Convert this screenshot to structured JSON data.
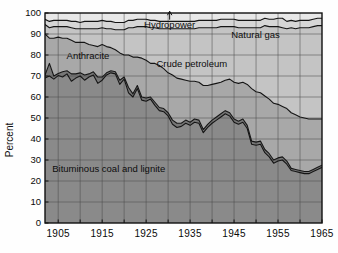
{
  "chart_data": {
    "type": "area",
    "stacked": true,
    "title": "",
    "xlabel": "",
    "ylabel": "Percent",
    "xlim": [
      1902,
      1965
    ],
    "ylim": [
      0,
      100
    ],
    "ytick_labels": [
      "0",
      "10",
      "20",
      "30",
      "40",
      "50",
      "60",
      "70",
      "80",
      "90",
      "100"
    ],
    "yticks": [
      0,
      10,
      20,
      30,
      40,
      50,
      60,
      70,
      80,
      90,
      100
    ],
    "xtick_labels": [
      "1905",
      "1915",
      "1925",
      "1935",
      "1945",
      "1955",
      "1965"
    ],
    "xticks": [
      1905,
      1915,
      1925,
      1935,
      1945,
      1955,
      1965
    ],
    "grid": true,
    "grid_x_step": 5,
    "grid_y_step": 10,
    "legend_position": "inline-annotations",
    "series_order_bottom_to_top": [
      "Bituminous coal and lignite",
      "Anthracite",
      "Crude petroleum",
      "Natural gas",
      "Hydropower"
    ],
    "x": [
      1902,
      1903,
      1904,
      1905,
      1906,
      1907,
      1908,
      1909,
      1910,
      1911,
      1912,
      1913,
      1914,
      1915,
      1916,
      1917,
      1918,
      1919,
      1920,
      1921,
      1922,
      1923,
      1924,
      1925,
      1926,
      1927,
      1928,
      1929,
      1930,
      1931,
      1932,
      1933,
      1934,
      1935,
      1936,
      1937,
      1938,
      1939,
      1940,
      1941,
      1942,
      1943,
      1944,
      1945,
      1946,
      1947,
      1948,
      1949,
      1950,
      1951,
      1952,
      1953,
      1954,
      1955,
      1956,
      1957,
      1958,
      1959,
      1960,
      1961,
      1962,
      1963,
      1964,
      1965
    ],
    "series": [
      {
        "name": "Bituminous coal and lignite",
        "color": "#8a8a8a",
        "label_text": "Bituminous coal and lignite",
        "values": [
          69.0,
          70.0,
          68.5,
          70.2,
          69.5,
          71.0,
          67.5,
          69.0,
          70.0,
          68.0,
          69.5,
          70.5,
          66.5,
          68.0,
          70.5,
          71.5,
          71.0,
          66.0,
          68.5,
          62.0,
          60.0,
          64.0,
          58.5,
          58.0,
          59.0,
          56.0,
          53.5,
          53.0,
          51.0,
          47.0,
          45.5,
          46.0,
          47.5,
          46.5,
          48.0,
          47.5,
          43.0,
          45.5,
          47.5,
          49.0,
          50.5,
          52.0,
          51.0,
          48.0,
          47.0,
          48.0,
          45.0,
          37.5,
          37.0,
          37.5,
          33.5,
          31.5,
          28.5,
          29.5,
          30.0,
          28.0,
          25.0,
          24.5,
          24.0,
          23.5,
          23.5,
          24.5,
          25.5,
          26.5
        ]
      },
      {
        "name": "Anthracite",
        "color": "#777777",
        "label_text": "Anthracite",
        "values": [
          1.5,
          6.0,
          1.5,
          1.0,
          2.5,
          1.5,
          3.5,
          2.0,
          1.5,
          2.5,
          1.5,
          1.5,
          3.0,
          1.5,
          1.0,
          1.0,
          1.0,
          2.0,
          1.0,
          2.5,
          1.5,
          1.5,
          1.5,
          1.5,
          1.0,
          1.5,
          1.5,
          1.5,
          1.5,
          2.0,
          2.0,
          1.5,
          1.5,
          1.5,
          1.5,
          1.5,
          1.5,
          1.5,
          1.5,
          1.5,
          1.5,
          1.5,
          1.5,
          1.5,
          1.5,
          1.5,
          1.5,
          1.5,
          1.5,
          1.5,
          1.5,
          1.5,
          1.5,
          1.5,
          1.5,
          1.5,
          1.0,
          1.0,
          1.0,
          1.0,
          1.0,
          1.0,
          1.0,
          1.0
        ]
      },
      {
        "name": "Crude petroleum",
        "color": "#a8a8a8",
        "label_text": "Crude petroleum",
        "values": [
          19.5,
          12.0,
          18.0,
          17.3,
          16.0,
          15.5,
          16.0,
          15.0,
          14.5,
          15.5,
          14.0,
          12.5,
          14.5,
          15.5,
          12.5,
          11.0,
          10.5,
          13.0,
          10.5,
          15.5,
          17.5,
          13.5,
          18.5,
          18.0,
          16.0,
          18.5,
          20.0,
          19.0,
          19.0,
          21.5,
          21.5,
          21.0,
          19.0,
          19.5,
          18.0,
          18.0,
          21.0,
          18.5,
          17.0,
          16.0,
          15.0,
          14.5,
          16.0,
          17.5,
          18.0,
          17.5,
          19.5,
          25.0,
          24.0,
          23.0,
          25.5,
          26.0,
          27.0,
          25.5,
          24.0,
          25.0,
          26.5,
          26.0,
          25.5,
          25.5,
          25.0,
          24.0,
          23.0,
          22.0
        ]
      },
      {
        "name": "Natural gas",
        "color": "#c4c4c4",
        "label_text": "Natural gas",
        "values": [
          4.5,
          5.0,
          5.5,
          5.0,
          5.5,
          5.5,
          6.0,
          6.5,
          6.5,
          6.5,
          7.5,
          8.0,
          8.5,
          8.0,
          8.5,
          9.0,
          9.5,
          11.0,
          12.0,
          13.0,
          14.0,
          14.5,
          15.0,
          16.0,
          17.0,
          17.0,
          17.5,
          19.0,
          21.0,
          22.0,
          23.5,
          24.0,
          24.5,
          25.0,
          25.0,
          26.0,
          27.5,
          27.5,
          27.0,
          26.5,
          26.5,
          25.5,
          25.0,
          26.5,
          26.5,
          26.0,
          27.0,
          29.0,
          30.5,
          31.0,
          33.5,
          34.5,
          36.5,
          37.0,
          37.5,
          38.0,
          40.5,
          41.0,
          42.5,
          43.0,
          43.5,
          44.0,
          44.5,
          44.5
        ]
      },
      {
        "name": "Hydropower",
        "color": "#d6d6d6",
        "label_text": "Hydropower",
        "values": [
          2.5,
          3.0,
          3.0,
          3.0,
          3.0,
          3.0,
          3.0,
          3.5,
          3.0,
          3.5,
          3.5,
          3.5,
          3.5,
          3.5,
          3.5,
          3.5,
          3.5,
          3.5,
          3.5,
          3.5,
          3.5,
          3.5,
          3.5,
          3.5,
          3.5,
          3.5,
          3.5,
          3.5,
          3.5,
          3.5,
          3.5,
          3.5,
          3.5,
          3.5,
          3.5,
          3.5,
          3.5,
          3.5,
          3.5,
          3.5,
          3.5,
          3.5,
          3.5,
          3.5,
          3.5,
          3.5,
          3.5,
          3.5,
          3.5,
          3.5,
          3.5,
          3.5,
          3.5,
          4.0,
          4.5,
          3.5,
          3.5,
          3.5,
          3.5,
          3.5,
          3.5,
          3.5,
          3.5,
          3.5
        ]
      }
    ],
    "annotations": [
      {
        "name": "hydropower",
        "text": "Hydropower",
        "x_pct": 45.0,
        "y_pct": 93.0,
        "leader": true
      },
      {
        "name": "natural-gas",
        "text": "Natural gas",
        "x_pct": 76.0,
        "y_pct": 88.0,
        "leader": false
      },
      {
        "name": "crude-petroleum",
        "text": "Crude petroleum",
        "x_pct": 53.0,
        "y_pct": 74.5,
        "leader": false
      },
      {
        "name": "anthracite",
        "text": "Anthracite",
        "x_pct": 15.5,
        "y_pct": 78.0,
        "leader": false
      },
      {
        "name": "bituminous-coal",
        "text": "Bituminous coal and lignite",
        "x_pct": 23.0,
        "y_pct": 24.5,
        "leader": false
      }
    ]
  },
  "colors": {
    "background": "#fefefe",
    "plot_border": "#111111",
    "grid": "#4a4a4a",
    "text": "#0d0d0d",
    "bituminous": "#8a8a8a",
    "anthracite": "#777777",
    "crude": "#a8a8a8",
    "natural_gas": "#c4c4c4",
    "hydropower": "#d6d6d6"
  }
}
